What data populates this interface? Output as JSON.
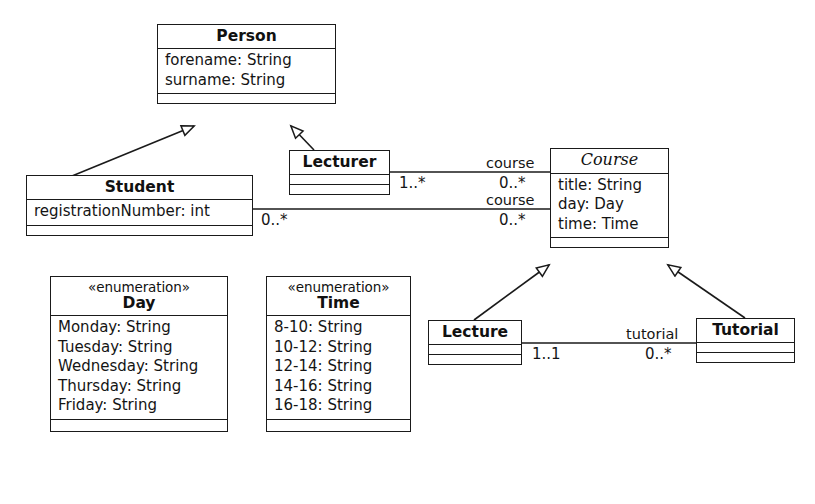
{
  "diagram": {
    "type": "uml-class-diagram",
    "background": "#ffffff",
    "stroke": "#1a1a1a"
  },
  "classes": {
    "person": {
      "name": "Person",
      "abstract": false,
      "attributes": [
        "forename: String",
        "surname: String"
      ],
      "operations": []
    },
    "student": {
      "name": "Student",
      "abstract": false,
      "attributes": [
        "registrationNumber: int"
      ],
      "operations": []
    },
    "lecturer": {
      "name": "Lecturer",
      "abstract": false,
      "attributes": [],
      "operations": []
    },
    "course": {
      "name": "Course",
      "abstract": true,
      "attributes": [
        "title: String",
        "day: Day",
        "time: Time"
      ],
      "operations": []
    },
    "lecture": {
      "name": "Lecture",
      "abstract": false,
      "attributes": [],
      "operations": []
    },
    "tutorial": {
      "name": "Tutorial",
      "abstract": false,
      "attributes": [],
      "operations": []
    }
  },
  "enumerations": {
    "day": {
      "stereotype": "«enumeration»",
      "name": "Day",
      "literals": [
        "Monday: String",
        "Tuesday: String",
        "Wednesday: String",
        "Thursday: String",
        "Friday: String"
      ]
    },
    "time": {
      "stereotype": "«enumeration»",
      "name": "Time",
      "literals": [
        "8-10: String",
        "10-12: String",
        "12-14: String",
        "14-16: String",
        "16-18: String"
      ]
    }
  },
  "associations": {
    "lecturer_course": {
      "role_label": "course",
      "source_multiplicity": "1..*",
      "target_multiplicity": "0..*"
    },
    "student_course": {
      "role_label": "course",
      "source_multiplicity": "0..*",
      "target_multiplicity": "0..*"
    },
    "lecture_tutorial": {
      "role_label": "tutorial",
      "source_multiplicity": "1..1",
      "target_multiplicity": "0..*"
    }
  },
  "generalizations": [
    {
      "from": "Student",
      "to": "Person"
    },
    {
      "from": "Lecturer",
      "to": "Person"
    },
    {
      "from": "Lecture",
      "to": "Course"
    },
    {
      "from": "Tutorial",
      "to": "Course"
    }
  ]
}
